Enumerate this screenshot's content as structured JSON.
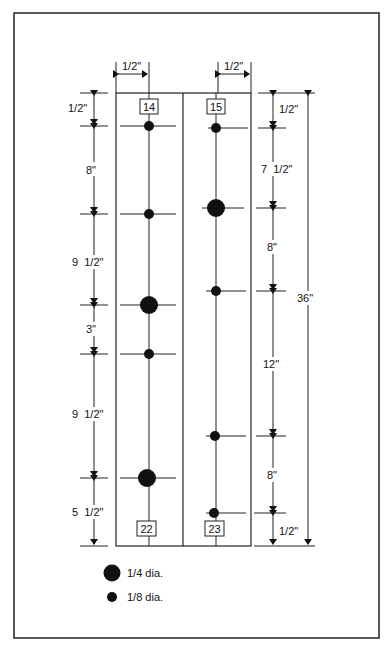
{
  "diagram": {
    "top_dims": {
      "left": "1/2\"",
      "right": "1/2\""
    },
    "left_column": {
      "top_label": "14",
      "bottom_label": "22",
      "dims": [
        "1/2\"",
        "8\"",
        "9  1/2\"",
        "3\"",
        "9  1/2\"",
        "5  1/2\""
      ],
      "holes": [
        {
          "y_in": 0.5,
          "size": "1/8"
        },
        {
          "y_in": 8.5,
          "size": "1/8"
        },
        {
          "y_in": 18,
          "size": "1/4"
        },
        {
          "y_in": 21,
          "size": "1/8"
        },
        {
          "y_in": 30.5,
          "size": "1/4"
        }
      ]
    },
    "right_column": {
      "top_label": "15",
      "bottom_label": "23",
      "dims": [
        "1/2\"",
        "7  1/2\"",
        "8\"",
        "12\"",
        "8\"",
        "1/2\""
      ],
      "holes": [
        {
          "y_in": 0.5,
          "size": "1/8"
        },
        {
          "y_in": 8,
          "size": "1/4"
        },
        {
          "y_in": 16,
          "size": "1/8"
        },
        {
          "y_in": 28,
          "size": "1/8"
        },
        {
          "y_in": 35.5,
          "size": "1/8"
        }
      ]
    },
    "overall_dim": "36\""
  },
  "legend": {
    "large": "1/4 dia.",
    "small": "1/8 dia."
  }
}
